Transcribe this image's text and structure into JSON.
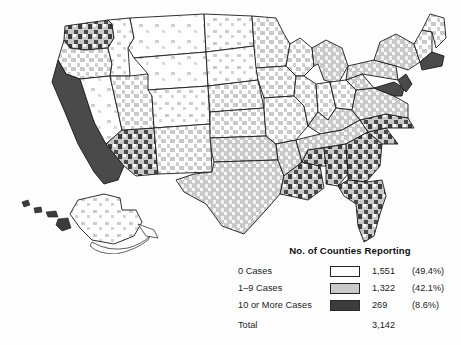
{
  "figure": {
    "kind": "choropleth-map",
    "region": "United States counties",
    "background_color": "#ffffff"
  },
  "legend": {
    "title": "No. of Counties Reporting",
    "rows": [
      {
        "label": "0 Cases",
        "swatch": "white-swatch",
        "color": "#ffffff",
        "count": "1,551",
        "percent": "(49.4%)"
      },
      {
        "label": "1–9 Cases",
        "swatch": "light-gray-swatch",
        "color": "#c9c9c9",
        "count": "1,322",
        "percent": "(42.1%)"
      },
      {
        "label": "10 or More Cases",
        "swatch": "dark-gray-swatch",
        "color": "#3c3c3c",
        "count": "269",
        "percent": "(8.6%)"
      }
    ],
    "total": {
      "label": "Total",
      "count": "3,142"
    }
  },
  "map_data": {
    "type": "choropleth",
    "projection": "albers-usa",
    "classes": [
      {
        "name": "0 Cases",
        "color": "#ffffff",
        "counties": 1551,
        "percent": 49.4
      },
      {
        "name": "1-9 Cases",
        "color": "#c9c9c9",
        "counties": 1322,
        "percent": 42.1
      },
      {
        "name": "10 or More Cases",
        "color": "#3c3c3c",
        "counties": 269,
        "percent": 8.6
      }
    ],
    "total_counties": 3142,
    "insets": [
      "alaska",
      "hawaii"
    ],
    "state_border_color": "#1a1a1a",
    "notes": "Dark concentrations in California, Arizona, coastal Pacific Northwest, Northeast corridor, Florida; light gray widespread across Texas, the Southeast and Midwest; white dominant in the Great Plains and Mountain West."
  }
}
